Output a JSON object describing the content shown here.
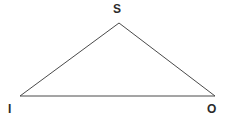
{
  "canvas": {
    "width": 232,
    "height": 126,
    "background_color": "#ffffff"
  },
  "figure": {
    "type": "triangle",
    "stroke_color": "#4a4a4a",
    "stroke_width": 1,
    "fill": "none"
  },
  "vertices": [
    {
      "id": "S",
      "label": "S",
      "x": 119,
      "y": 23,
      "label_position": "above"
    },
    {
      "id": "I",
      "label": "I",
      "x": 20,
      "y": 96,
      "label_position": "below-left"
    },
    {
      "id": "O",
      "label": "O",
      "x": 215,
      "y": 96,
      "label_position": "below-right"
    }
  ],
  "edges": [
    {
      "id": "IS",
      "from": "I",
      "to": "S"
    },
    {
      "id": "SO",
      "from": "S",
      "to": "O"
    },
    {
      "id": "IO",
      "from": "I",
      "to": "O"
    }
  ]
}
